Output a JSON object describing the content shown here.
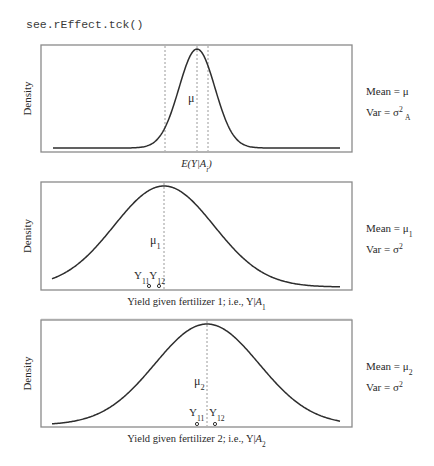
{
  "code_label": "see.rEffect.tck()",
  "chart_data": [
    {
      "type": "line",
      "title": "",
      "xlabel": "E(Y|A_i)",
      "ylabel": "Density",
      "distribution": "normal",
      "frame": {
        "x": 41,
        "y": 45,
        "w": 311,
        "h": 107
      },
      "peak_x": 197,
      "peak_y": 49,
      "base_y": 148,
      "sigma_px": 18,
      "curve_x0": 53,
      "curve_x1": 340,
      "vlines": [
        {
          "x": 165,
          "style": "dotted-light"
        },
        {
          "x": 197,
          "style": "dotted-dark"
        },
        {
          "x": 208,
          "style": "dotted-light"
        }
      ],
      "mean_label": {
        "text": "μ",
        "x": 188,
        "y": 102
      },
      "points": [],
      "annotations": {
        "mean": "Mean = μ",
        "var_base": "Var = σ",
        "var_sup": "2",
        "var_sub": "A"
      }
    },
    {
      "type": "line",
      "title": "",
      "xlabel": "Yield given fertilizer 1; i.e., Y|A",
      "xlabel_sub": "1",
      "ylabel": "Density",
      "distribution": "normal",
      "frame": {
        "x": 41,
        "y": 182,
        "w": 311,
        "h": 108
      },
      "peak_x": 164,
      "peak_y": 186,
      "base_y": 287,
      "sigma_px": 50,
      "curve_x0": 52,
      "curve_x1": 340,
      "vlines": [
        {
          "x": 164,
          "style": "dotted-light"
        }
      ],
      "mean_label": {
        "text": "μ",
        "sub": "1",
        "x": 150,
        "y": 244
      },
      "points": [
        {
          "label": "Y",
          "sub": "11",
          "x": 149,
          "y": 286,
          "filled": false
        },
        {
          "label": "Y",
          "sub": "12",
          "x": 159,
          "y": 286,
          "filled": false
        }
      ],
      "point_labels_y": 279,
      "annotations": {
        "mean": "Mean = μ",
        "mean_sub": "1",
        "var_base": "Var = σ",
        "var_sup": "2"
      }
    },
    {
      "type": "line",
      "title": "",
      "xlabel": "Yield given fertilizer 2; i.e., Y|A",
      "xlabel_sub": "2",
      "ylabel": "Density",
      "distribution": "normal",
      "frame": {
        "x": 41,
        "y": 320,
        "w": 311,
        "h": 107
      },
      "peak_x": 207,
      "peak_y": 324,
      "base_y": 425,
      "sigma_px": 52,
      "curve_x0": 52,
      "curve_x1": 340,
      "vlines": [
        {
          "x": 207,
          "style": "dotted-light"
        }
      ],
      "mean_label": {
        "text": "μ",
        "sub": "2",
        "x": 194,
        "y": 385
      },
      "points": [
        {
          "label": "Y",
          "sub": "11",
          "x": 197,
          "y": 424,
          "filled": false
        },
        {
          "label": "Y",
          "sub": "12",
          "x": 215,
          "y": 424,
          "filled": true
        }
      ],
      "point_labels_y": 416,
      "annotations": {
        "mean": "Mean = μ",
        "mean_sub": "2",
        "var_base": "Var = σ",
        "var_sup": "2"
      }
    }
  ]
}
